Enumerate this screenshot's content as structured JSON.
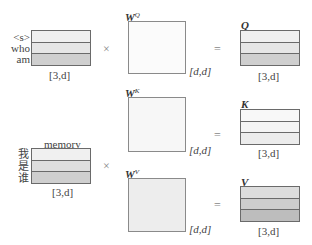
{
  "input_top": {
    "tokens": [
      "<s>",
      "who",
      "am"
    ],
    "shape": "[3,d]",
    "row_colors": [
      "#f0f0f0",
      "#e6e6e6",
      "#cfcfcf"
    ]
  },
  "memory": {
    "label": "memory",
    "tokens": [
      "我",
      "是",
      "谁"
    ],
    "shape": "[3,d]",
    "row_colors": [
      "#f0f0f0",
      "#dedede",
      "#cfcfcf"
    ]
  },
  "operators": {
    "times": "×",
    "equals": "="
  },
  "weights": {
    "wq": {
      "symbol": "W",
      "sup": "Q",
      "shape": "[d,d]",
      "fill": "#fbfbfb"
    },
    "wk": {
      "symbol": "W",
      "sup": "K",
      "shape": "[d,d]",
      "fill": "#f7f7f7"
    },
    "wv": {
      "symbol": "W",
      "sup": "V",
      "shape": "[d,d]",
      "fill": "#ededed"
    }
  },
  "outputs": {
    "q": {
      "label": "Q",
      "shape": "[3,d]",
      "row_colors": [
        "#f0f0f0",
        "#e6e6e6",
        "#cfcfcf"
      ]
    },
    "k": {
      "label": "K",
      "shape": "[3,d]",
      "row_colors": [
        "#f8f8f8",
        "#f4f4f4",
        "#ececec"
      ]
    },
    "v": {
      "label": "V",
      "shape": "[3,d]",
      "row_colors": [
        "#dddddd",
        "#cdcdcd",
        "#bdbdbd"
      ]
    }
  }
}
